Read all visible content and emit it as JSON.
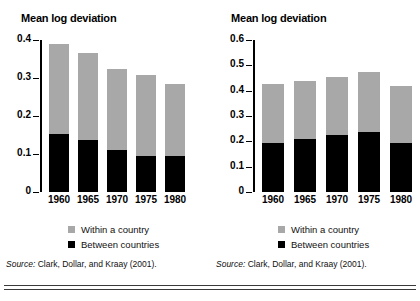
{
  "figure": {
    "legend": [
      {
        "label": "Within a country",
        "color": "#a8a8a8",
        "key": "within"
      },
      {
        "label": "Between countries",
        "color": "#000000",
        "key": "between"
      }
    ],
    "source_prefix": "Source:",
    "source_text": " Clark, Dollar, and Kraay (2001)."
  },
  "chart_data": [
    {
      "type": "bar",
      "stacked": true,
      "panel": "left",
      "title": "Mean log deviation",
      "xlabel": "",
      "ylabel": "Mean log deviation",
      "categories": [
        "1960",
        "1965",
        "1970",
        "1975",
        "1980"
      ],
      "ylim": [
        0,
        0.4
      ],
      "yticks": [
        "0",
        "0.1",
        "0.2",
        "0.3",
        "0.4"
      ],
      "ytick_values": [
        0,
        0.1,
        0.2,
        0.3,
        0.4
      ],
      "grid": false,
      "legend_position": "below",
      "series": [
        {
          "name": "Between countries",
          "color": "#000000",
          "values": [
            0.153,
            0.137,
            0.111,
            0.096,
            0.094
          ]
        },
        {
          "name": "Within a country",
          "color": "#a8a8a8",
          "values": [
            0.237,
            0.228,
            0.212,
            0.211,
            0.191
          ]
        }
      ],
      "totals": [
        0.39,
        0.365,
        0.323,
        0.307,
        0.285
      ]
    },
    {
      "type": "bar",
      "stacked": true,
      "panel": "right",
      "title": "Mean log deviation",
      "xlabel": "",
      "ylabel": "Mean log deviation",
      "categories": [
        "1960",
        "1965",
        "1970",
        "1975",
        "1980"
      ],
      "ylim": [
        0,
        0.6
      ],
      "yticks": [
        "0",
        "0.1",
        "0.2",
        "0.3",
        "0.4",
        "0.5",
        "0.6"
      ],
      "ytick_values": [
        0,
        0.1,
        0.2,
        0.3,
        0.4,
        0.5,
        0.6
      ],
      "grid": false,
      "legend_position": "below",
      "series": [
        {
          "name": "Between countries",
          "color": "#000000",
          "values": [
            0.195,
            0.21,
            0.225,
            0.235,
            0.195
          ]
        },
        {
          "name": "Within a country",
          "color": "#a8a8a8",
          "values": [
            0.23,
            0.23,
            0.23,
            0.24,
            0.225
          ]
        }
      ],
      "totals": [
        0.425,
        0.44,
        0.455,
        0.475,
        0.42
      ]
    }
  ]
}
